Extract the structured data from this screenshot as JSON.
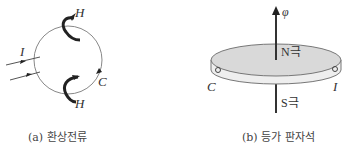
{
  "panel_a": {
    "caption": "(a) 환상전류",
    "labels": {
      "current": "I",
      "field_top": "H",
      "field_bottom": "H",
      "loop": "C"
    }
  },
  "panel_b": {
    "caption": "(b) 등가 판자석",
    "labels": {
      "flux": "φ",
      "north": "N극",
      "south": "S극",
      "loop": "C",
      "current": "I"
    }
  },
  "colors": {
    "line": "#555555",
    "disk_top": "#d9d9d9",
    "disk_edge": "#eeeeee",
    "arrow": "#222222"
  }
}
